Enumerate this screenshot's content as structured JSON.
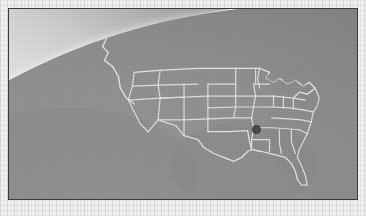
{
  "figure": {
    "kind": "earth-limb-satellite-map",
    "rendering": "grayscale halftone print / scanned plate"
  },
  "plate": {
    "frame_color": "#3a3a3a",
    "paper_color": "#f1f1ef",
    "frame_inset_px": 8,
    "width_px": 350,
    "height_px": 192
  },
  "scene": {
    "space_color": "#4f4f4f",
    "limb_glow_color": "#ffffff",
    "sky_color": "#d8d8d8",
    "land_color": "#8d8d8d",
    "ocean_color": "#8a8a8a",
    "border_line_color": "#e8e8e8",
    "coastline_color": "#ededed",
    "terminator_note": "bright atmospheric glow along the limb fading to dark space toward the upper right"
  },
  "features": [
    {
      "name": "earth-limb-arc",
      "label": "Earth limb",
      "kind": "arc"
    },
    {
      "name": "atmospheric-glow",
      "label": "Atmospheric glow",
      "kind": "gradient"
    },
    {
      "name": "pacific-ocean",
      "label": "Pacific Ocean",
      "kind": "water"
    },
    {
      "name": "gulf-of-mexico",
      "label": "Gulf of Mexico",
      "kind": "water"
    },
    {
      "name": "atlantic-ocean",
      "label": "Atlantic Ocean",
      "kind": "water"
    },
    {
      "name": "great-lakes",
      "label": "Great Lakes",
      "kind": "water"
    },
    {
      "name": "us-canada-border",
      "label": "United States - Canada border",
      "kind": "border"
    },
    {
      "name": "us-mexico-border",
      "label": "United States - Mexico border",
      "kind": "border"
    },
    {
      "name": "state-boundaries",
      "label": "State boundaries",
      "kind": "border"
    },
    {
      "name": "florida-peninsula",
      "label": "Florida peninsula",
      "kind": "coastline"
    },
    {
      "name": "baja-california",
      "label": "Baja California",
      "kind": "coastline"
    }
  ],
  "marker": {
    "label": "Location marker",
    "shape": "filled-circle",
    "color": "#4a4a4a",
    "diameter_px": 7,
    "position_px": {
      "x": 254,
      "y": 127
    },
    "region": "Southeastern United States"
  }
}
